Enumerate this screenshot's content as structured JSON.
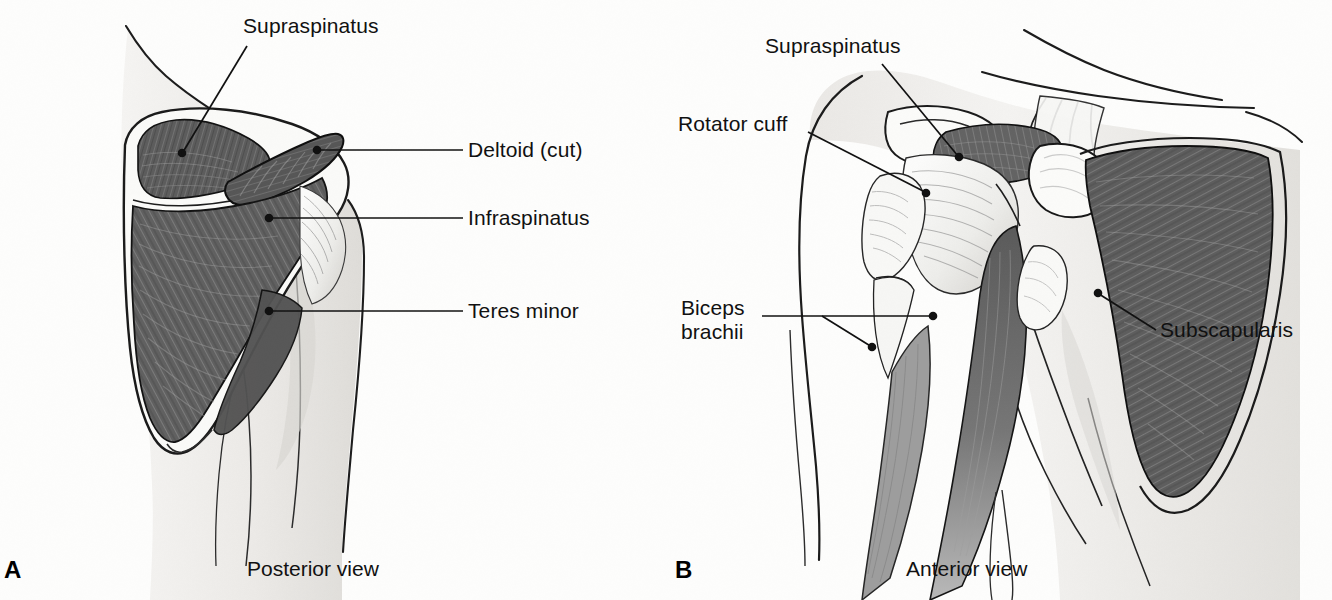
{
  "figure": {
    "background_color": "#fdfdfc",
    "ink_color": "#111111",
    "muscle_dark_color": "#5e5e5e",
    "muscle_mid_color": "#8a8a8a",
    "skin_color": "#f2f1ef"
  },
  "panels": [
    {
      "letter": "A",
      "caption": "Posterior view",
      "labels": [
        {
          "id": "supraspinatus-a",
          "text": "Supraspinatus"
        },
        {
          "id": "deltoid-cut",
          "text": "Deltoid (cut)"
        },
        {
          "id": "infraspinatus",
          "text": "Infraspinatus"
        },
        {
          "id": "teres-minor",
          "text": "Teres minor"
        }
      ]
    },
    {
      "letter": "B",
      "caption": "Anterior view",
      "labels": [
        {
          "id": "supraspinatus-b",
          "text": "Supraspinatus"
        },
        {
          "id": "rotator-cuff",
          "text": "Rotator cuff"
        },
        {
          "id": "biceps-line1",
          "text": "Biceps"
        },
        {
          "id": "biceps-line2",
          "text": "brachii"
        },
        {
          "id": "subscapularis",
          "text": "Subscapularis"
        }
      ]
    }
  ],
  "panel_a": {
    "letter": "A",
    "caption": "Posterior view",
    "supraspinatus": "Supraspinatus",
    "deltoid_cut": "Deltoid (cut)",
    "infraspinatus": "Infraspinatus",
    "teres_minor": "Teres minor"
  },
  "panel_b": {
    "letter": "B",
    "caption": "Anterior view",
    "supraspinatus": "Supraspinatus",
    "rotator_cuff": "Rotator cuff",
    "biceps_line1": "Biceps",
    "biceps_line2": "brachii",
    "subscapularis": "Subscapularis"
  }
}
